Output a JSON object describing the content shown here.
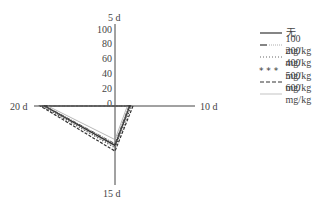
{
  "chart_data": {
    "type": "radar",
    "title": "",
    "axes": [
      "5 d",
      "10 d",
      "15 d",
      "20 d"
    ],
    "radial_ticks": [
      0,
      20,
      40,
      60,
      80,
      100
    ],
    "radial_range": [
      0,
      100
    ],
    "grid": false,
    "legend_position": "right",
    "series": [
      {
        "name": "无",
        "style": "solid",
        "values": [
          0,
          18,
          48,
          86
        ]
      },
      {
        "name": "100 mg/kg",
        "style": "dash-dot",
        "values": [
          0,
          17,
          46,
          85
        ]
      },
      {
        "name": "200 mg/kg",
        "style": "dotted",
        "values": [
          0,
          19,
          50,
          88
        ]
      },
      {
        "name": "400 mg/kg",
        "style": "asterisk",
        "values": [
          0,
          20,
          51,
          89
        ]
      },
      {
        "name": "500 mg/kg",
        "style": "dashed",
        "values": [
          0,
          22,
          55,
          91
        ]
      },
      {
        "name": "600 mg/kg",
        "style": "thin",
        "values": [
          0,
          15,
          41,
          82
        ]
      }
    ]
  },
  "labels": {
    "axis_top": "5 d",
    "axis_right": "10 d",
    "axis_bottom": "15 d",
    "axis_left": "20 d",
    "ticks": [
      "100",
      "80",
      "60",
      "40",
      "20",
      "0"
    ]
  },
  "legend": [
    {
      "label": "无"
    },
    {
      "label": "100 mg/kg"
    },
    {
      "label": "200 mg/kg"
    },
    {
      "label": "400 mg/kg"
    },
    {
      "label": "500 mg/kg"
    },
    {
      "label": "600 mg/kg"
    }
  ]
}
